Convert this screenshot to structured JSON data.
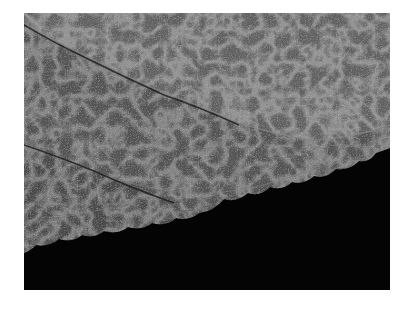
{
  "image": {
    "subject": "Macro photograph of overlapping leaf edges with scalloped margins",
    "palette": {
      "background": "#040404",
      "leaf_dark": "#3a3a3a",
      "leaf_mid": "#5a5a5a",
      "leaf_light": "#7a7a7a",
      "vein": "#8c8c8c"
    }
  }
}
